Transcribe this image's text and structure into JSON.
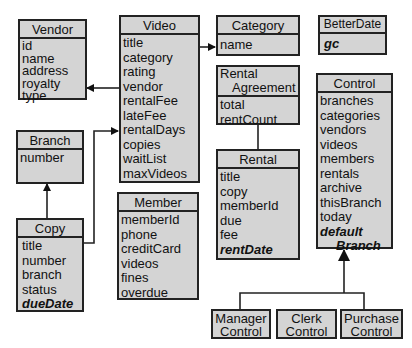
{
  "diagram": {
    "type": "uml-class-diagram",
    "classes": {
      "vendor": {
        "name": "Vendor",
        "attributes": [
          "id",
          "name",
          "address",
          "royalty",
          "type"
        ]
      },
      "video": {
        "name": "Video",
        "attributes": [
          "title",
          "category",
          "rating",
          "vendor",
          "rentalFee",
          "lateFee",
          "rentalDays",
          "copies",
          "waitList",
          "maxVideos"
        ]
      },
      "category": {
        "name": "Category",
        "attributes": [
          "name"
        ]
      },
      "betterdate": {
        "name": "BetterDate",
        "attributes": [],
        "emphasized": [
          "gc"
        ]
      },
      "branch": {
        "name": "Branch",
        "attributes": [
          "number"
        ]
      },
      "rental_agreement": {
        "name_line1": "Rental",
        "name_line2": "Agreement",
        "attributes": [
          "total",
          "rentCount"
        ]
      },
      "control": {
        "name": "Control",
        "attributes": [
          "branches",
          "categories",
          "vendors",
          "videos",
          "members",
          "rentals",
          "archive",
          "thisBranch",
          "today"
        ],
        "emphasized": [
          "default",
          "Branch"
        ]
      },
      "rental": {
        "name": "Rental",
        "attributes": [
          "title",
          "copy",
          "memberId",
          "due",
          "fee"
        ],
        "emphasized": [
          "rentDate"
        ]
      },
      "copy": {
        "name": "Copy",
        "attributes": [
          "title",
          "number",
          "branch",
          "status"
        ],
        "emphasized": [
          "dueDate"
        ]
      },
      "member": {
        "name": "Member",
        "attributes": [
          "memberId",
          "phone",
          "creditCard",
          "videos",
          "fines",
          "overdue"
        ]
      },
      "manager_control": {
        "line1": "Manager",
        "line2": "Control"
      },
      "clerk_control": {
        "line1": "Clerk",
        "line2": "Control"
      },
      "purchase_control": {
        "line1": "Purchase",
        "line2": "Control"
      }
    },
    "relationships": [
      {
        "from": "Video",
        "to": "Vendor",
        "kind": "association-arrow"
      },
      {
        "from": "Video",
        "to": "Category",
        "kind": "association-arrow"
      },
      {
        "from": "Copy",
        "to": "Video",
        "kind": "association-arrow"
      },
      {
        "from": "Copy",
        "to": "Branch",
        "kind": "association-arrow"
      },
      {
        "from": "Rental Agreement",
        "to": "Rental",
        "kind": "association-line"
      },
      {
        "from": "Manager Control",
        "to": "Control",
        "kind": "generalization"
      },
      {
        "from": "Clerk Control",
        "to": "Control",
        "kind": "generalization"
      },
      {
        "from": "Purchase Control",
        "to": "Control",
        "kind": "generalization"
      }
    ],
    "colors": {
      "box_fill": "#d4d4d4",
      "stroke": "#222222",
      "background": "#ffffff"
    }
  }
}
